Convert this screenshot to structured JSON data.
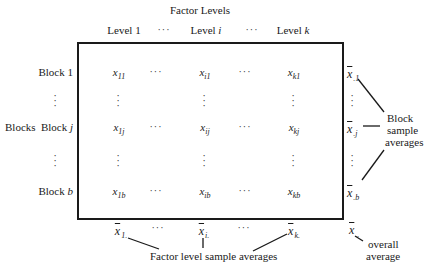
{
  "title": "Factor Levels",
  "column_headers": [
    {
      "label": "Level 1",
      "base": "Level ",
      "var": "1",
      "italic": false
    },
    {
      "label": "···"
    },
    {
      "label": "Level i",
      "base": "Level ",
      "var": "i",
      "italic": true
    },
    {
      "label": "···"
    },
    {
      "label": "Level k",
      "base": "Level ",
      "var": "k",
      "italic": true
    }
  ],
  "side_label": "Blocks",
  "row_headers": [
    {
      "base": "Block ",
      "var": "1",
      "italic": false
    },
    {
      "vdots": "⋮"
    },
    {
      "base": "Block ",
      "var": "j",
      "italic": true
    },
    {
      "vdots": "⋮"
    },
    {
      "base": "Block ",
      "var": "b",
      "italic": true
    }
  ],
  "matrix": {
    "symbol": "x",
    "hdots": "···",
    "vdots": "⋮",
    "rows": [
      [
        "11",
        "···",
        "i1",
        "···",
        "k1"
      ],
      [
        "⋮",
        "",
        "⋮",
        "",
        "⋮"
      ],
      [
        "1j",
        "···",
        "ij",
        "···",
        "kj"
      ],
      [
        "⋮",
        "",
        "⋮",
        "",
        "⋮"
      ],
      [
        "1b",
        "···",
        "ib",
        "···",
        "kb"
      ]
    ]
  },
  "block_averages": {
    "symbol": "x",
    "subscripts": [
      ".1",
      "⋮",
      ".j",
      "⋮",
      ".b"
    ],
    "label_lines": [
      "Block",
      "sample",
      "averages"
    ]
  },
  "factor_averages": {
    "symbol": "x",
    "items": [
      "1.",
      "···",
      "i.",
      "···",
      "k."
    ],
    "label": "Factor level sample averages"
  },
  "overall_average": {
    "symbol": "x",
    "subscript": "..",
    "label_lines": [
      "overall",
      "average"
    ]
  }
}
